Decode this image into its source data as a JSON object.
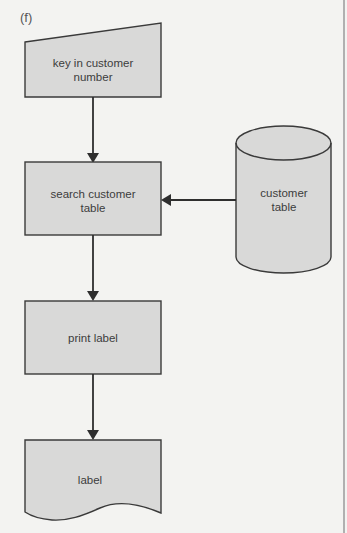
{
  "figure": {
    "panel_label": "(f)"
  },
  "nodes": [
    {
      "id": "input",
      "type": "manual-input",
      "lines": [
        "key in customer",
        "number"
      ]
    },
    {
      "id": "search",
      "type": "process",
      "lines": [
        "search customer",
        "table"
      ]
    },
    {
      "id": "db",
      "type": "database",
      "lines": [
        "customer",
        "table"
      ]
    },
    {
      "id": "print",
      "type": "process",
      "lines": [
        "print label"
      ]
    },
    {
      "id": "output",
      "type": "document",
      "lines": [
        "label"
      ]
    }
  ],
  "edges": [
    {
      "from": "key in customer number",
      "to": "search customer table"
    },
    {
      "from": "customer table",
      "to": "search customer table"
    },
    {
      "from": "search customer table",
      "to": "print label"
    },
    {
      "from": "print label",
      "to": "label"
    }
  ],
  "colors": {
    "background": "#f3f3f1",
    "shape_fill": "#d9d9d8",
    "stroke": "#3a3a3a"
  }
}
